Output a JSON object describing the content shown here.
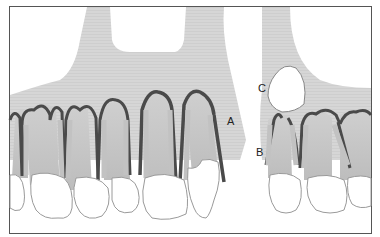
{
  "figure": {
    "labels": {
      "a": "A",
      "b": "B",
      "c": "C"
    },
    "colors": {
      "bone": "#d3d3d3",
      "cortical_line": "#4a4a4a",
      "root": "#c4c4c4",
      "crown_fill": "#ffffff",
      "outline": "#9a9a9a",
      "frame": "#555555",
      "fiber": "#777777"
    }
  }
}
